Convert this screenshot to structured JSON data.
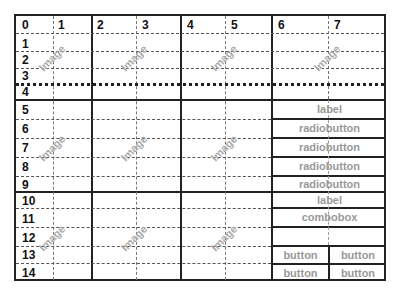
{
  "grid": {
    "column_numbers": [
      "0",
      "1",
      "2",
      "3",
      "4",
      "5",
      "6",
      "7"
    ],
    "row_numbers": [
      "0",
      "1",
      "2",
      "3",
      "4",
      "5",
      "6",
      "7",
      "8",
      "9",
      "10",
      "11",
      "12",
      "13",
      "14"
    ]
  },
  "image_placeholders": [
    {
      "label": "Image"
    },
    {
      "label": "Image"
    },
    {
      "label": "Image"
    },
    {
      "label": "Image"
    },
    {
      "label": "Image"
    },
    {
      "label": "Image"
    },
    {
      "label": "Image"
    },
    {
      "label": "Image"
    },
    {
      "label": "Image"
    },
    {
      "label": "Image"
    }
  ],
  "widgets": {
    "label_1": "label",
    "radiobuttons": [
      "radiobutton",
      "radiobutton",
      "radiobutton",
      "radiobutton"
    ],
    "label_2": "label",
    "combobox": "combobox",
    "buttons": [
      "button",
      "button",
      "button",
      "button"
    ]
  },
  "colors": {
    "grid_line": "#222222",
    "widget_text": "#999999",
    "image_text": "#aaaaaa"
  }
}
